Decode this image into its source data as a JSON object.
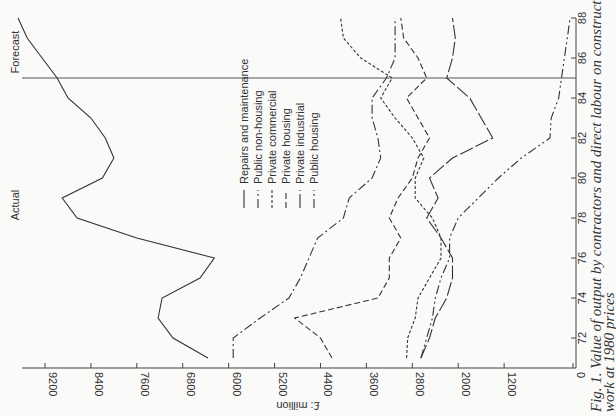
{
  "chart_data": {
    "type": "line",
    "orientation": "rotated-90-ccw",
    "title": "",
    "caption": "Fig. 1. Value of output by contractors and direct labour on construction work at 1980 prices",
    "caption_line1": "Fig. 1. Value of output by contractors and direct labour on construction",
    "caption_line2": "work at 1980 prices",
    "xlabel": "",
    "ylabel": "£: million",
    "x_ticks": [
      72,
      74,
      76,
      78,
      80,
      82,
      84,
      86,
      88
    ],
    "y_ticks": [
      0,
      1200,
      2000,
      2800,
      3600,
      4400,
      5200,
      6000,
      6800,
      7600,
      8400,
      9200
    ],
    "xlim": [
      71,
      88
    ],
    "ylim": [
      0,
      9600
    ],
    "grid": false,
    "annotations": {
      "actual_label": "Actual",
      "forecast_label": "Forecast",
      "forecast_divider_year": 85
    },
    "legend_position": "center-left (inside plot)",
    "x": [
      71,
      72,
      73,
      74,
      75,
      76,
      77,
      78,
      79,
      80,
      81,
      82,
      83,
      84,
      85,
      86,
      87,
      88
    ],
    "series": [
      {
        "name": "Repairs and maintenance",
        "style": "solid",
        "values": [
          6360,
          6970,
          7230,
          7160,
          6500,
          6250,
          7600,
          8640,
          8900,
          8200,
          8000,
          8150,
          8400,
          8800,
          8990,
          9250,
          9510,
          9670
        ]
      },
      {
        "name": "Public non-housing",
        "style": "dash-dot",
        "values": [
          5920,
          5920,
          5450,
          4950,
          4750,
          4600,
          4450,
          4000,
          3900,
          3500,
          3350,
          3400,
          3500,
          3500,
          3250,
          3100,
          3100,
          3100
        ]
      },
      {
        "name": "Private commercial",
        "style": "dotted",
        "values": [
          2900,
          2880,
          2750,
          2700,
          2500,
          2300,
          2300,
          2450,
          2750,
          2750,
          2600,
          2800,
          3100,
          3350,
          3150,
          3700,
          4000,
          4050
        ]
      },
      {
        "name": "Private housing",
        "style": "dashed",
        "values": [
          4200,
          4400,
          4850,
          3400,
          3200,
          3200,
          3000,
          3200,
          3050,
          2800,
          2700,
          2500,
          2700,
          2900,
          2550,
          2700,
          2950,
          3000
        ]
      },
      {
        "name": "Private industrial",
        "style": "long-dash",
        "values": [
          2650,
          2500,
          2400,
          2200,
          2100,
          2100,
          2300,
          2550,
          2350,
          2500,
          2100,
          1400,
          1600,
          1800,
          2200,
          2100,
          2050,
          2100
        ]
      },
      {
        "name": "Public housing",
        "style": "dash-dot-dot",
        "values": [
          2650,
          2550,
          2450,
          2400,
          2300,
          2150,
          2150,
          2000,
          1650,
          1300,
          900,
          400,
          380,
          250,
          200,
          150,
          100,
          50
        ]
      }
    ]
  },
  "legend": {
    "items": [
      {
        "label": "Repairs and maintenance",
        "style": "solid"
      },
      {
        "label": "Public non-housing",
        "style": "dash-dot"
      },
      {
        "label": "Private commercial",
        "style": "dotted"
      },
      {
        "label": "Private housing",
        "style": "dashed"
      },
      {
        "label": "Private industrial",
        "style": "long-dash"
      },
      {
        "label": "Public housing",
        "style": "dash-dot-dot"
      }
    ]
  },
  "colors": {
    "line": "#333333",
    "axis": "#444444",
    "background": "#fafaf8"
  }
}
